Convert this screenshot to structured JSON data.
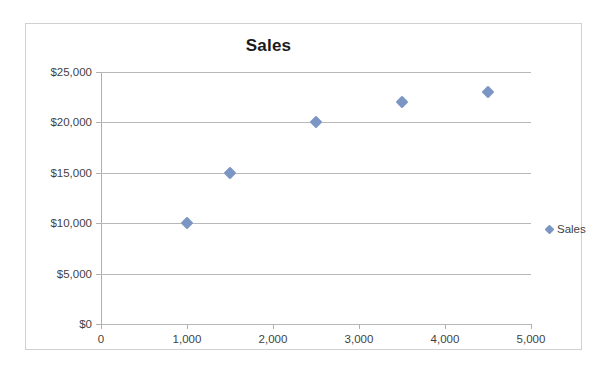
{
  "chart_data": {
    "type": "scatter",
    "title": "Sales",
    "xlabel": "",
    "ylabel": "",
    "x": [
      1000,
      1500,
      2500,
      3500,
      4500
    ],
    "values": [
      10000,
      15000,
      20000,
      22000,
      23000
    ],
    "series": [
      {
        "name": "Sales",
        "color": "#7B96C4",
        "marker": "diamond",
        "points": [
          {
            "x": 1000,
            "y": 10000
          },
          {
            "x": 1500,
            "y": 15000
          },
          {
            "x": 2500,
            "y": 20000
          },
          {
            "x": 3500,
            "y": 22000
          },
          {
            "x": 4500,
            "y": 23000
          }
        ]
      }
    ],
    "xlim": [
      0,
      5000
    ],
    "ylim": [
      0,
      25000
    ],
    "x_tick_values": [
      0,
      1000,
      2000,
      3000,
      4000,
      5000
    ],
    "x_tick_labels": [
      "0",
      "1,000",
      "2,000",
      "3,000",
      "4,000",
      "5,000"
    ],
    "y_tick_values": [
      0,
      5000,
      10000,
      15000,
      20000,
      25000
    ],
    "y_tick_labels": [
      "$0",
      "$5,000",
      "$10,000",
      "$15,000",
      "$20,000",
      "$25,000"
    ],
    "grid": {
      "horizontal": true,
      "vertical": false
    },
    "legend": {
      "position": "right",
      "entries": [
        "Sales"
      ]
    },
    "colors": {
      "marker": "#7B96C4",
      "gridline": "#B8B8B8",
      "axis": "#B0B0B0",
      "frame": "#D0D0D0",
      "title_text": "#1A1A1A",
      "tick_text": "#3F3F3F"
    }
  }
}
